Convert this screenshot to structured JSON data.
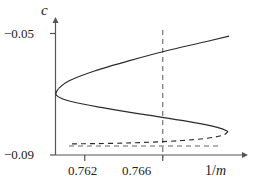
{
  "chart_data": {
    "type": "line",
    "title": "",
    "xlabel": "1/m",
    "ylabel": "c",
    "xticks": [
      0.762,
      0.766
    ],
    "xtick_labels": [
      "0.762",
      "0.766"
    ],
    "yticks": [
      -0.05,
      -0.09
    ],
    "ytick_labels": [
      "−0.05",
      "−0.09"
    ],
    "xlim": [
      0.7605,
      0.7695
    ],
    "ylim": [
      -0.0935,
      -0.0465
    ],
    "grid": false,
    "legend": null,
    "annotations": [
      {
        "name": "reference-line-horizontal",
        "style": "dashed",
        "orientation": "horizontal",
        "value": -0.05
      },
      {
        "name": "reference-line-vertical",
        "style": "dashed",
        "orientation": "vertical",
        "value": 0.766
      }
    ],
    "series": [
      {
        "name": "upper-branch-unstable",
        "style": "dashed",
        "points": [
          [
            0.76135,
            -0.0508
          ],
          [
            0.7625,
            -0.0509
          ],
          [
            0.764,
            -0.0511
          ],
          [
            0.7655,
            -0.0515
          ],
          [
            0.767,
            -0.0521
          ],
          [
            0.7683,
            -0.053
          ],
          [
            0.7691,
            -0.0542
          ],
          [
            0.76935,
            -0.0556
          ]
        ]
      },
      {
        "name": "middle-branch",
        "style": "solid",
        "points": [
          [
            0.76935,
            -0.0556
          ],
          [
            0.7688,
            -0.0572
          ],
          [
            0.7672,
            -0.0596
          ],
          [
            0.765,
            -0.0622
          ],
          [
            0.7629,
            -0.0648
          ],
          [
            0.7613,
            -0.0672
          ],
          [
            0.76055,
            -0.0696
          ],
          [
            0.76065,
            -0.0722
          ]
        ]
      },
      {
        "name": "lower-branch",
        "style": "solid",
        "points": [
          [
            0.76065,
            -0.0722
          ],
          [
            0.7612,
            -0.0752
          ],
          [
            0.7625,
            -0.079
          ],
          [
            0.7643,
            -0.083
          ],
          [
            0.7664,
            -0.0872
          ],
          [
            0.7683,
            -0.0905
          ],
          [
            0.7694,
            -0.0925
          ]
        ]
      }
    ],
    "turning_points": [
      {
        "name": "upper-fold",
        "x": 0.76935,
        "y": -0.0556
      },
      {
        "name": "lower-fold",
        "x": 0.76055,
        "y": -0.0709
      }
    ]
  },
  "axes": {
    "y_title": "c",
    "x_title_numerator": "1/",
    "x_title_denominator": "m",
    "ytick_top": "−0.05",
    "ytick_bottom": "−0.09",
    "xtick_left": "0.762",
    "xtick_right": "0.766"
  },
  "colors": {
    "curve": "#2b2b2b",
    "axis": "#555555",
    "dash": "#666666",
    "background": "#ffffff"
  }
}
